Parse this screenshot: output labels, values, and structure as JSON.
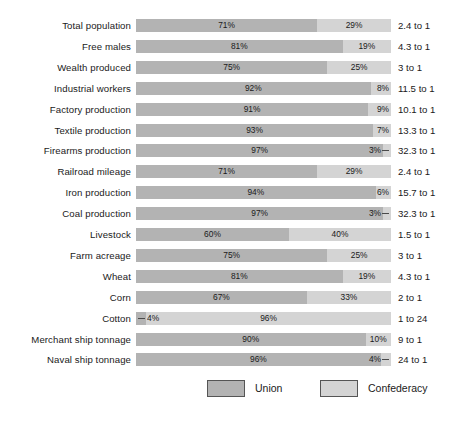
{
  "chart_data": {
    "type": "bar",
    "subtype": "100% stacked horizontal bar",
    "title": "",
    "subtitle": "",
    "xlabel": "",
    "ylabel": "",
    "xlim": [
      0,
      100
    ],
    "grid": false,
    "legend_position": "bottom",
    "categories": [
      "Total population",
      "Free males",
      "Wealth produced",
      "Industrial workers",
      "Factory production",
      "Textile production",
      "Firearms production",
      "Railroad mileage",
      "Iron production",
      "Coal production",
      "Livestock",
      "Farm acreage",
      "Wheat",
      "Corn",
      "Cotton",
      "Merchant ship tonnage",
      "Naval ship tonnage"
    ],
    "series": [
      {
        "name": "Union",
        "color": "#b3b3b3",
        "values": [
          71,
          81,
          75,
          92,
          91,
          93,
          97,
          71,
          94,
          97,
          60,
          75,
          81,
          67,
          4,
          90,
          96
        ]
      },
      {
        "name": "Confederacy",
        "color": "#d4d4d4",
        "values": [
          29,
          19,
          25,
          8,
          9,
          7,
          3,
          29,
          6,
          3,
          40,
          25,
          19,
          33,
          96,
          10,
          4
        ]
      }
    ],
    "annotations": {
      "label": "Ratio",
      "values": [
        "2.4 to 1",
        "4.3 to 1",
        "3 to 1",
        "11.5 to 1",
        "10.1 to 1",
        "13.3 to 1",
        "32.3 to 1",
        "2.4 to 1",
        "15.7 to 1",
        "32.3 to 1",
        "1.5 to 1",
        "3 to 1",
        "4.3 to 1",
        "2 to 1",
        "1 to 24",
        "9 to 1",
        "24 to 1"
      ]
    }
  },
  "rows": [
    {
      "label": "Total population",
      "union": 71,
      "conf": 29,
      "union_label": "71%",
      "conf_label": "29%",
      "ratio": "2.4 to 1",
      "union_label_inside": true,
      "conf_label_inside": true,
      "leader": "none"
    },
    {
      "label": "Free males",
      "union": 81,
      "conf": 19,
      "union_label": "81%",
      "conf_label": "19%",
      "ratio": "4.3 to 1",
      "union_label_inside": true,
      "conf_label_inside": true,
      "leader": "none"
    },
    {
      "label": "Wealth produced",
      "union": 75,
      "conf": 25,
      "union_label": "75%",
      "conf_label": "25%",
      "ratio": "3 to 1",
      "union_label_inside": true,
      "conf_label_inside": true,
      "leader": "none"
    },
    {
      "label": "Industrial workers",
      "union": 92,
      "conf": 8,
      "union_label": "92%",
      "conf_label": "8%",
      "ratio": "11.5 to 1",
      "union_label_inside": true,
      "conf_label_inside": false,
      "leader": "none"
    },
    {
      "label": "Factory production",
      "union": 91,
      "conf": 9,
      "union_label": "91%",
      "conf_label": "9%",
      "ratio": "10.1 to 1",
      "union_label_inside": true,
      "conf_label_inside": false,
      "leader": "none"
    },
    {
      "label": "Textile production",
      "union": 93,
      "conf": 7,
      "union_label": "93%",
      "conf_label": "7%",
      "ratio": "13.3 to 1",
      "union_label_inside": true,
      "conf_label_inside": false,
      "leader": "none"
    },
    {
      "label": "Firearms production",
      "union": 97,
      "conf": 3,
      "union_label": "97%",
      "conf_label": "3%",
      "ratio": "32.3 to 1",
      "union_label_inside": true,
      "conf_label_inside": false,
      "leader": "right"
    },
    {
      "label": "Railroad mileage",
      "union": 71,
      "conf": 29,
      "union_label": "71%",
      "conf_label": "29%",
      "ratio": "2.4 to 1",
      "union_label_inside": true,
      "conf_label_inside": true,
      "leader": "none"
    },
    {
      "label": "Iron production",
      "union": 94,
      "conf": 6,
      "union_label": "94%",
      "conf_label": "6%",
      "ratio": "15.7 to 1",
      "union_label_inside": true,
      "conf_label_inside": false,
      "leader": "none"
    },
    {
      "label": "Coal production",
      "union": 97,
      "conf": 3,
      "union_label": "97%",
      "conf_label": "3%",
      "ratio": "32.3 to 1",
      "union_label_inside": true,
      "conf_label_inside": false,
      "leader": "right"
    },
    {
      "label": "Livestock",
      "union": 60,
      "conf": 40,
      "union_label": "60%",
      "conf_label": "40%",
      "ratio": "1.5 to 1",
      "union_label_inside": true,
      "conf_label_inside": true,
      "leader": "none"
    },
    {
      "label": "Farm acreage",
      "union": 75,
      "conf": 25,
      "union_label": "75%",
      "conf_label": "25%",
      "ratio": "3 to 1",
      "union_label_inside": true,
      "conf_label_inside": true,
      "leader": "none"
    },
    {
      "label": "Wheat",
      "union": 81,
      "conf": 19,
      "union_label": "81%",
      "conf_label": "19%",
      "ratio": "4.3 to 1",
      "union_label_inside": true,
      "conf_label_inside": true,
      "leader": "none"
    },
    {
      "label": "Corn",
      "union": 67,
      "conf": 33,
      "union_label": "67%",
      "conf_label": "33%",
      "ratio": "2 to 1",
      "union_label_inside": true,
      "conf_label_inside": true,
      "leader": "none"
    },
    {
      "label": "Cotton",
      "union": 4,
      "conf": 96,
      "union_label": "4%",
      "conf_label": "96%",
      "ratio": "1 to 24",
      "union_label_inside": false,
      "conf_label_inside": true,
      "leader": "left"
    },
    {
      "label": "Merchant ship tonnage",
      "union": 90,
      "conf": 10,
      "union_label": "90%",
      "conf_label": "10%",
      "ratio": "9 to 1",
      "union_label_inside": true,
      "conf_label_inside": true,
      "leader": "none"
    },
    {
      "label": "Naval ship tonnage",
      "union": 96,
      "conf": 4,
      "union_label": "96%",
      "conf_label": "4%",
      "ratio": "24 to 1",
      "union_label_inside": true,
      "conf_label_inside": false,
      "leader": "right"
    }
  ],
  "legend": {
    "union": {
      "label": "Union",
      "color": "#b3b3b3"
    },
    "confederacy": {
      "label": "Confederacy",
      "color": "#d4d4d4"
    }
  }
}
